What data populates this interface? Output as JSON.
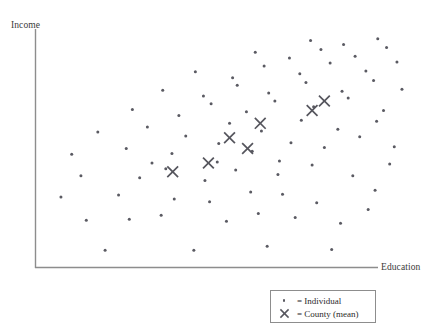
{
  "figure": {
    "y_axis_title": "Income",
    "x_axis_title": "Education"
  },
  "legend": {
    "individual_symbol": "dot",
    "individual_label": "= Individual",
    "county_symbol": "x-cross",
    "county_label": "= County (mean)"
  },
  "style": {
    "axis_color": "#8d8d8d",
    "point_color": "#5a5a62",
    "cross_color": "#55555d",
    "background": "#ffffff",
    "legend_border": "#8d8d8d"
  },
  "chart_data": {
    "type": "scatter",
    "title": "",
    "subtitle": "",
    "xlabel": "Education",
    "ylabel": "Income",
    "xlim": [
      0,
      100
    ],
    "ylim": [
      0,
      100
    ],
    "grid": false,
    "axis_ticks": false,
    "legend_position": "bottom-right",
    "annotations": [],
    "series": [
      {
        "name": "Individual",
        "marker": "dot",
        "color": "#5a5a62",
        "points": [
          [
            18.0,
            6.3
          ],
          [
            41.1,
            6.3
          ],
          [
            60.2,
            8.1
          ],
          [
            77.0,
            6.7
          ],
          [
            13.1,
            19.2
          ],
          [
            24.3,
            19.6
          ],
          [
            32.6,
            21.3
          ],
          [
            49.6,
            18.8
          ],
          [
            57.9,
            22.1
          ],
          [
            67.5,
            20.4
          ],
          [
            79.3,
            17.9
          ],
          [
            86.5,
            23.8
          ],
          [
            6.5,
            29.2
          ],
          [
            21.5,
            30.0
          ],
          [
            36.0,
            28.3
          ],
          [
            45.2,
            27.1
          ],
          [
            55.9,
            31.3
          ],
          [
            64.2,
            30.4
          ],
          [
            73.1,
            26.7
          ],
          [
            88.3,
            32.1
          ],
          [
            11.7,
            38.3
          ],
          [
            27.0,
            37.5
          ],
          [
            33.8,
            41.3
          ],
          [
            44.0,
            36.3
          ],
          [
            52.0,
            40.8
          ],
          [
            63.0,
            38.8
          ],
          [
            71.9,
            42.9
          ],
          [
            82.5,
            38.3
          ],
          [
            92.1,
            43.3
          ],
          [
            9.3,
            47.5
          ],
          [
            23.5,
            50.0
          ],
          [
            35.4,
            47.9
          ],
          [
            47.6,
            52.1
          ],
          [
            56.3,
            48.8
          ],
          [
            66.4,
            52.5
          ],
          [
            75.1,
            50.4
          ],
          [
            84.3,
            55.0
          ],
          [
            93.3,
            50.8
          ],
          [
            16.1,
            57.1
          ],
          [
            29.0,
            59.2
          ],
          [
            39.0,
            55.4
          ],
          [
            50.4,
            60.8
          ],
          [
            58.7,
            57.5
          ],
          [
            69.1,
            62.1
          ],
          [
            78.6,
            58.3
          ],
          [
            88.7,
            61.7
          ],
          [
            25.1,
            66.7
          ],
          [
            37.2,
            64.2
          ],
          [
            45.6,
            69.2
          ],
          [
            54.8,
            65.8
          ],
          [
            62.2,
            70.4
          ],
          [
            72.3,
            67.9
          ],
          [
            81.3,
            71.7
          ],
          [
            90.5,
            66.3
          ],
          [
            33.0,
            75.0
          ],
          [
            43.6,
            72.5
          ],
          [
            52.4,
            77.1
          ],
          [
            60.6,
            73.8
          ],
          [
            70.3,
            78.3
          ],
          [
            79.7,
            74.6
          ],
          [
            87.9,
            79.2
          ],
          [
            95.3,
            75.4
          ],
          [
            41.5,
            82.9
          ],
          [
            51.2,
            80.4
          ],
          [
            59.4,
            85.4
          ],
          [
            68.7,
            82.1
          ],
          [
            76.6,
            86.7
          ],
          [
            85.9,
            83.3
          ],
          [
            94.0,
            87.1
          ],
          [
            57.1,
            91.3
          ],
          [
            66.0,
            88.8
          ],
          [
            74.2,
            92.5
          ],
          [
            83.1,
            89.6
          ],
          [
            91.3,
            93.3
          ],
          [
            71.5,
            96.3
          ],
          [
            80.1,
            94.6
          ],
          [
            89.0,
            97.1
          ],
          [
            63.4,
            44.6
          ],
          [
            47.2,
            44.2
          ],
          [
            30.2,
            43.8
          ]
        ]
      },
      {
        "name": "County (mean)",
        "marker": "x-cross",
        "color": "#55555d",
        "points": [
          [
            35.6,
            40.0
          ],
          [
            44.9,
            43.8
          ],
          [
            50.4,
            54.6
          ],
          [
            55.1,
            50.0
          ],
          [
            58.4,
            60.8
          ],
          [
            71.9,
            66.3
          ],
          [
            75.1,
            70.4
          ]
        ]
      }
    ]
  }
}
